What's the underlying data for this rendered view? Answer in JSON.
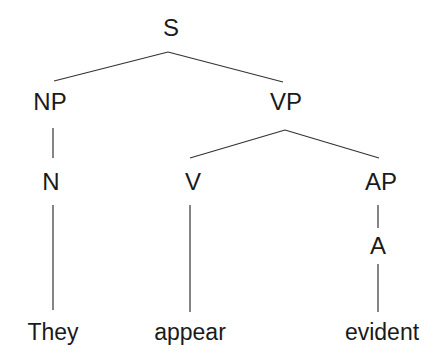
{
  "diagram": {
    "type": "syntax-tree",
    "nodes": {
      "S": {
        "label": "S"
      },
      "NP": {
        "label": "NP"
      },
      "VP": {
        "label": "VP"
      },
      "N": {
        "label": "N"
      },
      "V": {
        "label": "V"
      },
      "AP": {
        "label": "AP"
      },
      "A": {
        "label": "A"
      },
      "they": {
        "label": "They"
      },
      "appear": {
        "label": "appear"
      },
      "evident": {
        "label": "evident"
      }
    },
    "edges": [
      [
        "S",
        "NP"
      ],
      [
        "S",
        "VP"
      ],
      [
        "NP",
        "N"
      ],
      [
        "VP",
        "V"
      ],
      [
        "VP",
        "AP"
      ],
      [
        "AP",
        "A"
      ],
      [
        "N",
        "They"
      ],
      [
        "V",
        "appear"
      ],
      [
        "A",
        "evident"
      ]
    ],
    "line_color": "#333333"
  }
}
